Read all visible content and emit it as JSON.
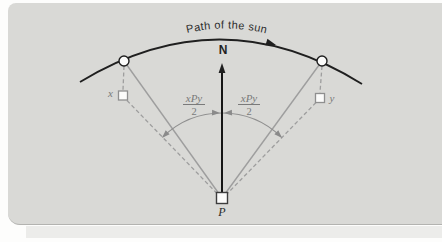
{
  "figure": {
    "title": "Path of the sun",
    "north_label": "N",
    "observer_label": "P",
    "point_x_label": "x",
    "point_y_label": "y",
    "angle_left": {
      "numerator": "xPy",
      "denominator": "2"
    },
    "angle_right": {
      "numerator": "xPy",
      "denominator": "2"
    }
  },
  "colors": {
    "panel_background": "#d9d9d6",
    "page_background": "#fdfdfc",
    "dark_line": "#1f1f1f",
    "gray_line": "#9e9e9e",
    "gray_label": "#7a7a7a",
    "dark_label": "#2a2a2a"
  }
}
